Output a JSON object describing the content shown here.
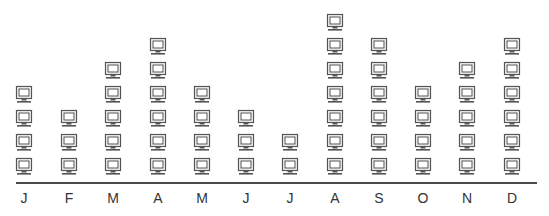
{
  "chart_data": {
    "type": "pictograph",
    "title": "",
    "xlabel": "",
    "ylabel": "",
    "icon": "computer-monitor-icon",
    "categories": [
      "J",
      "F",
      "M",
      "A",
      "M",
      "J",
      "J",
      "A",
      "S",
      "O",
      "N",
      "D"
    ],
    "values": [
      4,
      3,
      5,
      6,
      4,
      3,
      2,
      7,
      6,
      4,
      5,
      6
    ],
    "grid": false,
    "legend": null
  },
  "colors": {
    "icon_stroke": "#555555",
    "axis": "#4a4a4a",
    "label": "#333333"
  },
  "layout": {
    "centers": [
      24,
      69,
      113,
      158,
      202,
      246,
      290,
      335,
      379,
      423,
      467,
      512
    ]
  }
}
